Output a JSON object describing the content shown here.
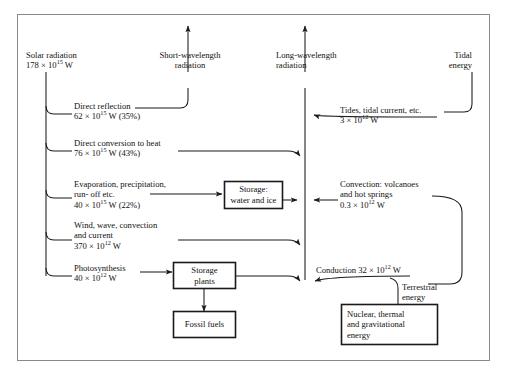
{
  "figure": {
    "frame_color": "#8a8a8a",
    "line_color": "#1a1a1a",
    "caption": ""
  },
  "sources": {
    "solar": {
      "name": "Solar radiation",
      "value": "178 × 10",
      "exp": "15",
      "unit": " W"
    },
    "short_wave": {
      "line1": "Short-wavelength",
      "line2": "radiation"
    },
    "long_wave": {
      "line1": "Long-wavelength",
      "line2": "radiation"
    },
    "tidal": {
      "line1": "Tidal",
      "line2": "energy"
    }
  },
  "flows": [
    {
      "id": "direct-reflection",
      "line1": "Direct reflection",
      "value": "62 × 10",
      "exp": "15",
      "unit": " W (35%)"
    },
    {
      "id": "direct-conversion-heat",
      "line1": "Direct conversion to heat",
      "value": "76 × 10",
      "exp": "15",
      "unit": " W (43%)"
    },
    {
      "id": "evaporation",
      "line1": "Evaporation, precipitation,",
      "line2": "run- off etc.",
      "value": "40 × 10",
      "exp": "15",
      "unit": " W (22%)"
    },
    {
      "id": "wind-wave",
      "line1": "Wind, wave, convection",
      "line2": "and current",
      "value": "370 × 10",
      "exp": "12",
      "unit": " W"
    },
    {
      "id": "photosynthesis",
      "line1": "Photosynthesis",
      "value": "40 × 10",
      "exp": "12",
      "unit": " W"
    }
  ],
  "right_flows": [
    {
      "id": "tides",
      "line1": "Tides, tidal current, etc.",
      "value": "3 × 10",
      "exp": "12",
      "unit": " W"
    },
    {
      "id": "convection",
      "line1": "Convection: volcanoes",
      "line2": "and hot springs",
      "value": "0.3 × 10",
      "exp": "12",
      "unit": " W"
    },
    {
      "id": "conduction",
      "line1": "Conduction 32 × 10",
      "exp": "12",
      "unit": " W"
    }
  ],
  "terrestrial": {
    "line1": "Terrestrial",
    "line2": "energy"
  },
  "boxes": [
    {
      "id": "storage-water-ice",
      "line1": "Storage:",
      "line2": "water and ice"
    },
    {
      "id": "storage-plants",
      "line1": "Storage",
      "line2": "plants"
    },
    {
      "id": "fossil-fuels",
      "line1": "Fossil fuels"
    },
    {
      "id": "nuclear-thermal-grav",
      "line1": "Nuclear, thermal",
      "line2": "and gravitational",
      "line3": "energy"
    }
  ]
}
